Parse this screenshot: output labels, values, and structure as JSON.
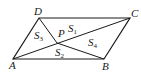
{
  "figure": {
    "type": "parallelogram",
    "vertices": {
      "A": {
        "label": "A",
        "x": 13,
        "y": 59
      },
      "B": {
        "label": "B",
        "x": 104,
        "y": 59
      },
      "C": {
        "label": "C",
        "x": 130,
        "y": 18
      },
      "D": {
        "label": "D",
        "x": 39,
        "y": 18
      }
    },
    "interior_point": {
      "label": "P",
      "x": 57,
      "y": 43
    },
    "regions": [
      {
        "id": "S1",
        "letter": "S",
        "sub": "1",
        "triangle": "PDC"
      },
      {
        "id": "S2",
        "letter": "S",
        "sub": "2",
        "triangle": "PAB"
      },
      {
        "id": "S3",
        "letter": "S",
        "sub": "3",
        "triangle": "PAD"
      },
      {
        "id": "S4",
        "letter": "S",
        "sub": "4",
        "triangle": "PBC"
      }
    ],
    "colors": {
      "line": "#1a1a1a",
      "background": "#ffffff"
    }
  }
}
